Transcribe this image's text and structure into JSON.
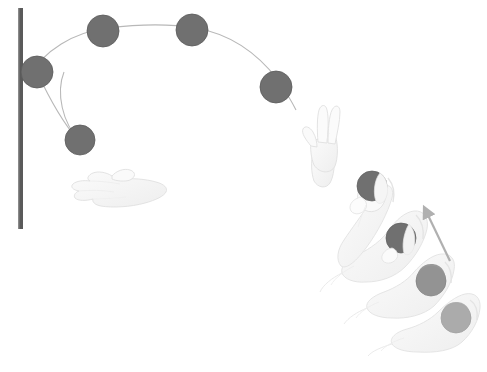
{
  "illustration": {
    "title": "Ball throw and pendulum arc motion study",
    "background_color": "#ffffff",
    "width": 487,
    "height": 372
  },
  "palette": {
    "wall_bar": "#5a5a5a",
    "ball_dark": "#707070",
    "ball_mid": "#8f8f8f",
    "ball_light": "#a8a8a8",
    "arc_line": "#b8b8b8",
    "hand_fill": "#f4f4f4",
    "hand_outline": "#d8d8d8",
    "hand_shade": "#e9e9e9",
    "arrow": "#b0b0b0"
  },
  "wall_bar": {
    "label": "vertical-wall-bar",
    "x": 20,
    "y_top": 8,
    "y_bottom": 229,
    "thickness": 5,
    "color": "#5a5a5a"
  },
  "arc_trajectory": {
    "label": "pendulum-arc-path",
    "color": "#b8b8b8",
    "stroke_width": 1.1,
    "path": "M 80,140 C 60,120 62,70 80,55 C 100,36 140,16 175,16 C 215,16 250,40 272,72 C 282,86 288,96 292,104"
  },
  "balls_on_arc": [
    {
      "id": "ball-arc-1",
      "label": "ball-at-wall",
      "cx": 37,
      "cy": 72,
      "r": 16,
      "color": "#707070"
    },
    {
      "id": "ball-arc-2",
      "label": "ball-rising",
      "cx": 103,
      "cy": 31,
      "r": 16,
      "color": "#707070"
    },
    {
      "id": "ball-arc-3",
      "label": "ball-apex",
      "cx": 192,
      "cy": 30,
      "r": 16,
      "color": "#707070"
    },
    {
      "id": "ball-arc-4",
      "label": "ball-descending",
      "cx": 276,
      "cy": 87,
      "r": 16,
      "color": "#707070"
    },
    {
      "id": "ball-arc-5",
      "label": "ball-below-wall",
      "cx": 80,
      "cy": 140,
      "r": 15,
      "color": "#707070"
    }
  ],
  "hands": [
    {
      "id": "hand-catch-left",
      "label": "open-catching-hand-left",
      "pose": "palm-open-horizontal"
    },
    {
      "id": "hand-reach-mid",
      "label": "reaching-hand-middle",
      "pose": "fingers-up-open"
    },
    {
      "id": "hand-throw-1",
      "label": "throwing-hand-release",
      "pose": "grip-release-top"
    },
    {
      "id": "hand-throw-2",
      "label": "throwing-hand-upper-mid",
      "pose": "grip-ball"
    },
    {
      "id": "hand-throw-3",
      "label": "throwing-hand-lower-mid",
      "pose": "grip-ball"
    },
    {
      "id": "hand-throw-4",
      "label": "throwing-hand-start",
      "pose": "grip-ball"
    }
  ],
  "throw_sequence_balls": [
    {
      "id": "throw-ball-1",
      "label": "ball-released",
      "cx": 372,
      "cy": 186,
      "r": 15,
      "color": "#707070"
    },
    {
      "id": "throw-ball-2",
      "label": "ball-in-grip-2",
      "cx": 401,
      "cy": 238,
      "r": 15,
      "color": "#707070"
    },
    {
      "id": "throw-ball-3",
      "label": "ball-in-grip-3",
      "cx": 431,
      "cy": 281,
      "r": 15,
      "color": "#8f8f8f"
    },
    {
      "id": "throw-ball-4",
      "label": "ball-in-grip-4",
      "cx": 456,
      "cy": 318,
      "r": 15,
      "color": "#a8a8a8"
    }
  ],
  "motion_arrow": {
    "label": "upward-motion-arrow",
    "from_x": 450,
    "from_y": 261,
    "to_x": 426,
    "to_y": 211,
    "color": "#b0b0b0",
    "stroke_width": 2.2,
    "direction": "up-left"
  }
}
